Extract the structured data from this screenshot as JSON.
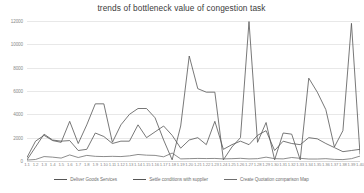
{
  "chart_data": {
    "type": "line",
    "title": "trends of bottleneck value of congestion task",
    "xlabel": "",
    "ylabel": "",
    "ylim": [
      0,
      12000
    ],
    "ytick_values": [
      0,
      2000,
      4000,
      6000,
      8000,
      10000,
      12000
    ],
    "ytick_labels": [
      "0",
      "2000",
      "4000",
      "6000",
      "8000",
      "10000",
      "12000"
    ],
    "grid": true,
    "legend_position": "bottom",
    "x": [
      "1.1",
      "1.2",
      "1.3",
      "1.4",
      "1.5",
      "1.6",
      "1.7",
      "1.8",
      "1.9",
      "1.10",
      "1.11",
      "1.12",
      "1.13",
      "1.14",
      "1.15",
      "1.16",
      "1.17",
      "1.18",
      "1.19",
      "1.20",
      "1.21",
      "1.22",
      "1.23",
      "1.24",
      "1.25",
      "1.26",
      "1.27",
      "1.28",
      "1.29",
      "1.30",
      "1.31",
      "1.32",
      "1.33",
      "1.34",
      "1.35",
      "1.36",
      "1.37",
      "1.38",
      "1.39",
      "1.40"
    ],
    "series": [
      {
        "name": "Deliver Goods Services",
        "color": "#555555",
        "values": [
          300,
          1700,
          2200,
          1750,
          1600,
          3400,
          1500,
          3100,
          4900,
          4900,
          1600,
          3100,
          4000,
          4500,
          4500,
          3700,
          1800,
          100,
          3000,
          9000,
          6200,
          5900,
          5900,
          100,
          1200,
          2000,
          11950,
          1600,
          3300,
          100,
          2400,
          2300,
          100,
          7100,
          5900,
          4400,
          1200,
          2600,
          11800,
          600
        ]
      },
      {
        "name": "Settle conditions with supplier",
        "color": "#555555",
        "values": [
          100,
          1200,
          2300,
          1800,
          1700,
          1750,
          900,
          1000,
          2400,
          2100,
          1500,
          1700,
          1700,
          3100,
          2000,
          2500,
          3000,
          2200,
          1100,
          1800,
          2000,
          1400,
          3400,
          1000,
          1400,
          1700,
          1400,
          2200,
          2600,
          900,
          1700,
          1500,
          1400,
          2000,
          1900,
          1500,
          1150,
          800,
          900,
          1000
        ]
      },
      {
        "name": "Create Quotation comparison Map",
        "color": "#6e6e6e",
        "values": [
          80,
          130,
          380,
          330,
          250,
          520,
          300,
          480,
          400,
          380,
          400,
          380,
          440,
          560,
          500,
          480,
          360,
          680,
          180,
          200,
          220,
          210,
          220,
          180,
          200,
          230,
          180,
          200,
          330,
          200,
          180,
          300,
          230,
          170,
          170,
          200,
          140,
          120,
          200,
          420
        ]
      }
    ]
  }
}
